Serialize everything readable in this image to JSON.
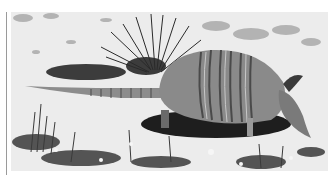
{
  "image": {
    "subject": "armadillo",
    "description": "Black-and-white photograph of a nine-banded armadillo walking on sandy ground with sparse grass and a spiky yucca-like plant behind it",
    "palette": {
      "sand": "#e9e9e9",
      "sand_light": "#f6f6f6",
      "shadow": "#1e1e1e",
      "shell": "#8a8a8a",
      "shell_dark": "#4a4a4a",
      "grass": "#3a3a3a",
      "rule": "#9a9a9a"
    }
  }
}
